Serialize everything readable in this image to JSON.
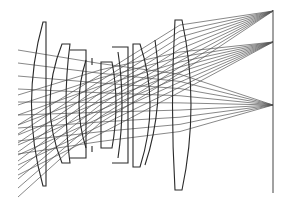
{
  "diagram": {
    "title": "",
    "type": "optical-ray-trace",
    "colors": {
      "background": "#ffffff",
      "lens": "#2a2a2a",
      "ray": "#555555",
      "image_plane": "#444444"
    },
    "lens_elements": [
      {
        "id": "L1",
        "shape": "meniscus"
      },
      {
        "id": "L2",
        "shape": "meniscus"
      },
      {
        "id": "L3",
        "shape": "biconcave"
      },
      {
        "id": "L4",
        "shape": "plano-convex"
      },
      {
        "id": "L5",
        "shape": "biconvex"
      },
      {
        "id": "L6",
        "shape": "biconvex"
      },
      {
        "id": "L7",
        "shape": "biconvex-large"
      }
    ],
    "field_focus_points_y": [
      11,
      42,
      105
    ],
    "image_plane": {
      "x": 273,
      "y_top": 10,
      "y_bottom": 193
    }
  }
}
